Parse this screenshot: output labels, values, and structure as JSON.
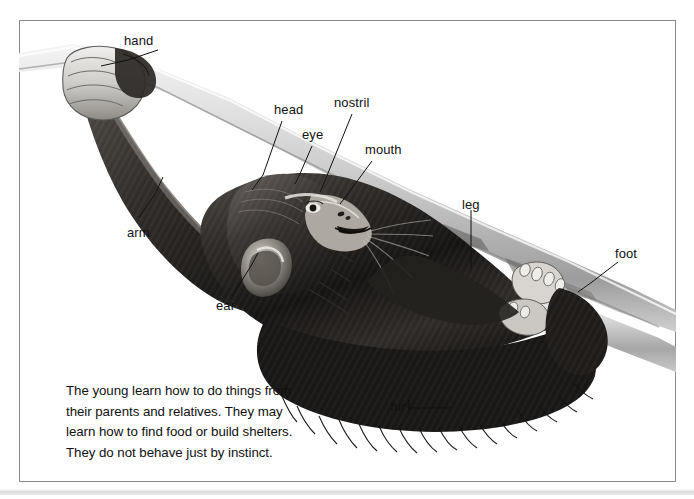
{
  "figure": {
    "kind": "labeled-anatomy-illustration",
    "top_remnant": "",
    "frame_color": "#8a8a8a",
    "background_color": "#ffffff",
    "label_color": "#111111"
  },
  "labels": [
    {
      "id": "hand",
      "text": "hand",
      "x": 124,
      "y": 34,
      "leader": [
        [
          158,
          50
        ],
        [
          128,
          60
        ],
        [
          101,
          66
        ]
      ]
    },
    {
      "id": "head",
      "text": "head",
      "x": 274,
      "y": 103,
      "leader": [
        [
          282,
          121
        ],
        [
          263,
          175
        ],
        [
          252,
          190
        ]
      ]
    },
    {
      "id": "eye",
      "text": "eye",
      "x": 302,
      "y": 128,
      "leader": [
        [
          312,
          146
        ],
        [
          299,
          176
        ],
        [
          295,
          184
        ]
      ]
    },
    {
      "id": "nostril",
      "text": "nostril",
      "x": 334,
      "y": 96,
      "leader": [
        [
          352,
          114
        ],
        [
          326,
          178
        ],
        [
          320,
          192
        ]
      ]
    },
    {
      "id": "mouth",
      "text": "mouth",
      "x": 365,
      "y": 143,
      "leader": [
        [
          372,
          161
        ],
        [
          347,
          195
        ],
        [
          340,
          204
        ]
      ]
    },
    {
      "id": "arm",
      "text": "arm",
      "x": 127,
      "y": 226,
      "leader": [
        [
          139,
          218
        ],
        [
          155,
          194
        ],
        [
          163,
          177
        ]
      ]
    },
    {
      "id": "ear",
      "text": "ear",
      "x": 216,
      "y": 299,
      "leader": [
        [
          232,
          296
        ],
        [
          251,
          266
        ],
        [
          258,
          253
        ]
      ]
    },
    {
      "id": "leg",
      "text": "leg",
      "x": 462,
      "y": 198,
      "leader": [
        [
          471,
          210
        ],
        [
          471,
          252
        ],
        [
          471,
          268
        ]
      ]
    },
    {
      "id": "foot",
      "text": "foot",
      "x": 615,
      "y": 247,
      "leader": [
        [
          618,
          262
        ],
        [
          592,
          282
        ],
        [
          578,
          292
        ]
      ]
    },
    {
      "id": "fur",
      "text": "fur",
      "x": 390,
      "y": 400,
      "leader": [
        [
          409,
          408
        ],
        [
          440,
          408
        ],
        [
          452,
          408
        ]
      ]
    }
  ],
  "caption": {
    "lines": [
      "The young learn how to do things from",
      "their parents and relatives. They may",
      "learn how to find food or build shelters.",
      "They do not behave just by instinct."
    ]
  }
}
